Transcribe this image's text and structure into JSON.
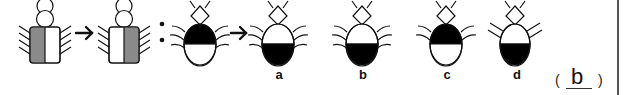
{
  "puzzle": {
    "premise_sequence": [
      {
        "id": "figure-1",
        "shape": "bug-rect-body",
        "shaded": "left-half",
        "shade_color": "#8a8a8a"
      },
      {
        "relation": "arrow-right"
      },
      {
        "id": "figure-2",
        "shape": "bug-rect-body",
        "shaded": "right-half",
        "shade_color": "#8a8a8a"
      },
      {
        "relation": "colon"
      },
      {
        "id": "figure-3",
        "shape": "bug-oval-body",
        "shaded": "top-half",
        "shade_color": "#000000"
      },
      {
        "relation": "arrow-right"
      }
    ],
    "options": [
      {
        "label": "a",
        "shaded": "bottom-half",
        "legs": "curved"
      },
      {
        "label": "b",
        "shaded": "bottom-half",
        "legs": "curved"
      },
      {
        "label": "c",
        "shaded": "top-half",
        "legs": "curved"
      },
      {
        "label": "d",
        "shaded": "bottom-half",
        "legs": "straight"
      }
    ],
    "answer": {
      "open_paren": "(",
      "value": "b",
      "close_paren": ")"
    }
  },
  "colors": {
    "gray_fill": "#8a8a8a",
    "black_fill": "#000000",
    "stroke": "#111111"
  }
}
